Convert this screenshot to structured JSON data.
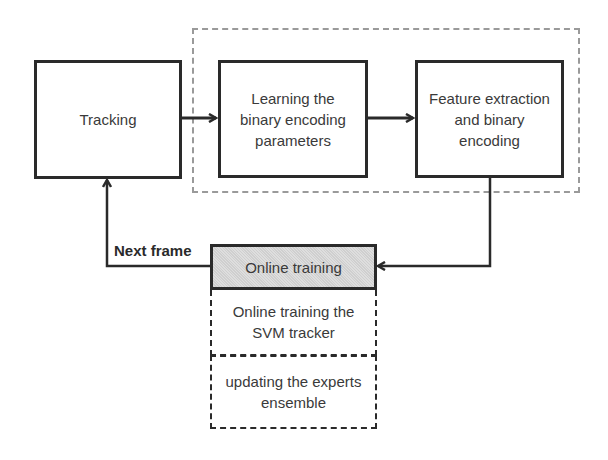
{
  "diagram": {
    "nodes": {
      "tracking": "Tracking",
      "learning": "Learning the binary encoding parameters",
      "feature": "Feature extraction and binary encoding",
      "online_training": "Online training",
      "svm": "Online training the SVM tracker",
      "experts": "updating the experts ensemble"
    },
    "edge_labels": {
      "next_frame": "Next frame"
    },
    "colors": {
      "stroke": "#2a2a2a",
      "group_border": "#9a9a9a",
      "highlight_fill": "#d6d6d6"
    }
  }
}
